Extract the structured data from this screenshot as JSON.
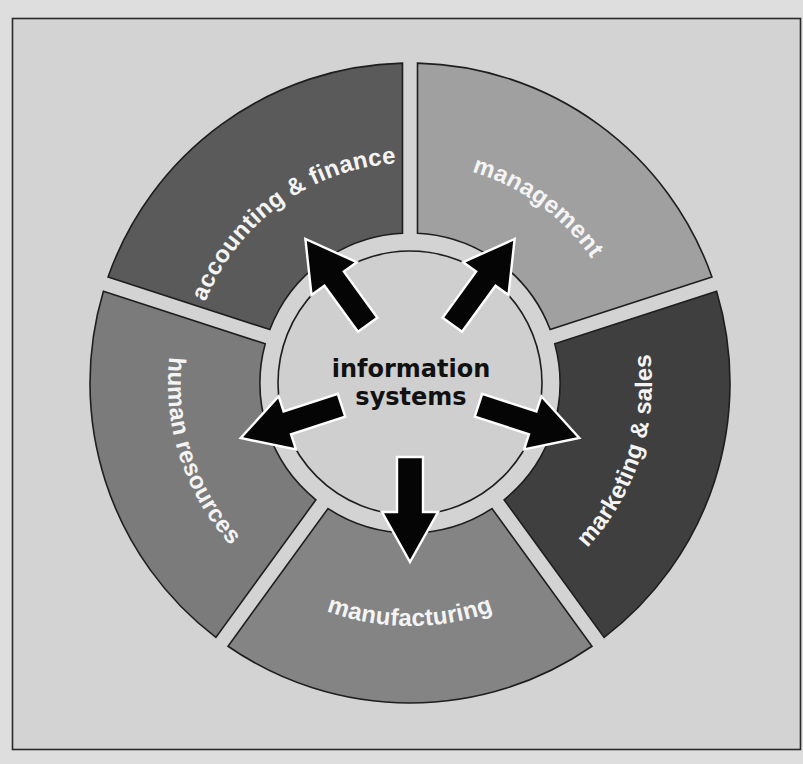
{
  "diagram": {
    "center": {
      "line1": "information",
      "line2": "systems",
      "fill": "#cfcfcf"
    },
    "segments": [
      {
        "id": "management",
        "label": "management",
        "color": "#a0a0a0",
        "center_angle_deg": 36
      },
      {
        "id": "marketing",
        "label": "marketing & sales",
        "color": "#3f3f3f",
        "center_angle_deg": 108
      },
      {
        "id": "manufacturing",
        "label": "manufacturing",
        "color": "#848484",
        "center_angle_deg": 180
      },
      {
        "id": "human-resources",
        "label": "human resources",
        "color": "#7b7b7b",
        "center_angle_deg": 252
      },
      {
        "id": "accounting",
        "label": "accounting & finance",
        "color": "#5a5a5a",
        "center_angle_deg": 324
      }
    ],
    "arrows": [
      {
        "from": "information systems",
        "to": "management"
      },
      {
        "from": "information systems",
        "to": "marketing & sales"
      },
      {
        "from": "information systems",
        "to": "manufacturing"
      },
      {
        "from": "information systems",
        "to": "human resources"
      },
      {
        "from": "information systems",
        "to": "accounting & finance"
      }
    ]
  },
  "colors": {
    "page_background": "#dedede",
    "panel_background": "#d3d3d3",
    "arrow_fill": "#050505",
    "arrow_outline": "#ffffff",
    "label_text": "#f4f4f4",
    "center_text": "#111111"
  }
}
